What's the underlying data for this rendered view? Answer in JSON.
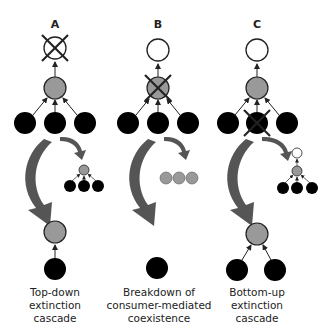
{
  "colors": {
    "top_predator": "#ffffff",
    "consumer": "#999999",
    "resource": "#000000",
    "big_arrow": "#555555",
    "stroke": "#222222"
  },
  "panels": [
    {
      "letter": "A",
      "caption": [
        "Top-down",
        "extinction",
        "cascade"
      ],
      "extinct_node": "top-predator"
    },
    {
      "letter": "B",
      "caption": [
        "Breakdown of",
        "consumer-mediated",
        "coexistence"
      ],
      "extinct_node": "consumer"
    },
    {
      "letter": "C",
      "caption": [
        "Bottom-up",
        "extinction",
        "cascade"
      ],
      "extinct_node": "middle-resource"
    }
  ]
}
